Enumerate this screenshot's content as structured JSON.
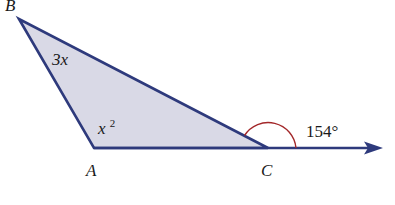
{
  "diagram": {
    "type": "triangle-exterior-angle",
    "vertices": {
      "A": {
        "label": "A",
        "x": 94,
        "y": 148
      },
      "B": {
        "label": "B",
        "x": 19,
        "y": 19
      },
      "C": {
        "label": "C",
        "x": 268,
        "y": 148
      }
    },
    "ray_end": {
      "x": 382,
      "y": 148
    },
    "angle_labels": {
      "B": "3x",
      "A_base": "x",
      "A_exp": "2",
      "exterior_C": "154°"
    },
    "colors": {
      "stroke": "#2e3a7c",
      "fill": "#d9d9e6",
      "arc": "#a3282a",
      "text": "#1a1a1a"
    }
  }
}
